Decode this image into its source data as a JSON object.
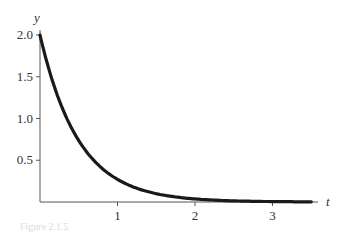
{
  "chart_data": {
    "type": "line",
    "title": "",
    "xlabel": "t",
    "ylabel": "y",
    "xlim": [
      0,
      3.6
    ],
    "ylim": [
      0,
      2.0
    ],
    "x_ticks": [
      "1",
      "2",
      "3"
    ],
    "y_ticks": [
      "0.5",
      "1.0",
      "1.5",
      "2.0"
    ],
    "grid": false,
    "series": [
      {
        "name": "y = 2e^(-2t)",
        "x": [
          0,
          0.25,
          0.5,
          0.75,
          1.0,
          1.25,
          1.5,
          2.0,
          2.5,
          3.0,
          3.5
        ],
        "values": [
          2.0,
          1.21,
          0.74,
          0.45,
          0.27,
          0.16,
          0.1,
          0.04,
          0.01,
          0.005,
          0.002
        ]
      }
    ]
  },
  "labels": {
    "x_axis": "t",
    "y_axis": "y",
    "ticks_x": [
      "1",
      "2",
      "3"
    ],
    "ticks_y": [
      "2.0",
      "1.5",
      "1.0",
      "0.5"
    ]
  },
  "caption": "Figure 2.1.5"
}
